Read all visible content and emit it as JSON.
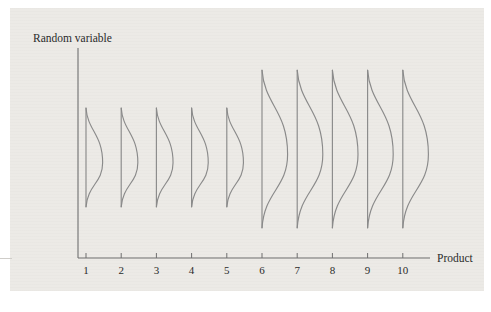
{
  "figure": {
    "name": "random-variable-by-product-distribution-plot",
    "background_color": "#eceae6",
    "line_color": "#8a8a8a",
    "axis_color": "#6f6f6f",
    "text_color": "#2a2a2a"
  },
  "axes": {
    "y_label": "Random variable",
    "x_label": "Product"
  },
  "chart_data": {
    "type": "line",
    "title": "",
    "subtitle": "",
    "xlabel": "Product",
    "ylabel": "Random variable",
    "grid": false,
    "legend": "none",
    "categories": [
      "1",
      "2",
      "3",
      "4",
      "5",
      "6",
      "7",
      "8",
      "9",
      "10"
    ],
    "x": [
      1,
      2,
      3,
      4,
      5,
      6,
      7,
      8,
      9,
      10
    ],
    "xlim": [
      0,
      11
    ],
    "ylim": [
      0,
      100
    ],
    "x_tick_labels": [
      "1",
      "2",
      "3",
      "4",
      "5",
      "6",
      "7",
      "8",
      "9",
      "10"
    ],
    "y_tick_labels": [],
    "series": [
      {
        "name": "distribution range top",
        "values": [
          72,
          72,
          72,
          72,
          72,
          90,
          90,
          90,
          90,
          90
        ]
      },
      {
        "name": "distribution range bottom",
        "values": [
          25,
          25,
          25,
          25,
          25,
          15,
          15,
          15,
          15,
          15
        ]
      },
      {
        "name": "distribution mode (peak location)",
        "values": [
          46,
          46,
          46,
          46,
          46,
          50,
          50,
          50,
          50,
          50
        ]
      },
      {
        "name": "distribution spread (peak width)",
        "values": [
          13,
          13,
          13,
          13,
          13,
          20,
          20,
          20,
          20,
          20
        ]
      }
    ],
    "distributions": [
      {
        "product": "1",
        "top": 72,
        "bottom": 25,
        "mode": 46,
        "spread": 13,
        "group": "low-variance"
      },
      {
        "product": "2",
        "top": 72,
        "bottom": 25,
        "mode": 46,
        "spread": 13,
        "group": "low-variance"
      },
      {
        "product": "3",
        "top": 72,
        "bottom": 25,
        "mode": 46,
        "spread": 13,
        "group": "low-variance"
      },
      {
        "product": "4",
        "top": 72,
        "bottom": 25,
        "mode": 46,
        "spread": 13,
        "group": "low-variance"
      },
      {
        "product": "5",
        "top": 72,
        "bottom": 25,
        "mode": 46,
        "spread": 13,
        "group": "low-variance"
      },
      {
        "product": "6",
        "top": 90,
        "bottom": 15,
        "mode": 50,
        "spread": 20,
        "group": "high-variance"
      },
      {
        "product": "7",
        "top": 90,
        "bottom": 15,
        "mode": 50,
        "spread": 20,
        "group": "high-variance"
      },
      {
        "product": "8",
        "top": 90,
        "bottom": 15,
        "mode": 50,
        "spread": 20,
        "group": "high-variance"
      },
      {
        "product": "9",
        "top": 90,
        "bottom": 15,
        "mode": 50,
        "spread": 20,
        "group": "high-variance"
      },
      {
        "product": "10",
        "top": 90,
        "bottom": 15,
        "mode": 50,
        "spread": 20,
        "group": "high-variance"
      }
    ]
  }
}
